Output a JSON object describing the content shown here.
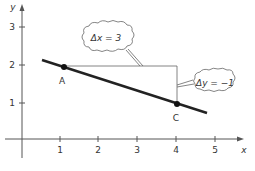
{
  "axes": {
    "x_label": "x",
    "y_label": "y",
    "x_ticks": [
      "1",
      "2",
      "3",
      "4",
      "5"
    ],
    "y_ticks": [
      "1",
      "2",
      "3"
    ]
  },
  "points": {
    "A": {
      "label": "A",
      "x": 1,
      "y": 2
    },
    "C": {
      "label": "C",
      "x": 4,
      "y": 1
    }
  },
  "callouts": {
    "run": "Δx = 3",
    "rise": "Δy = −1"
  },
  "colors": {
    "line": "#222222",
    "axis": "#555555",
    "text": "#333333"
  }
}
